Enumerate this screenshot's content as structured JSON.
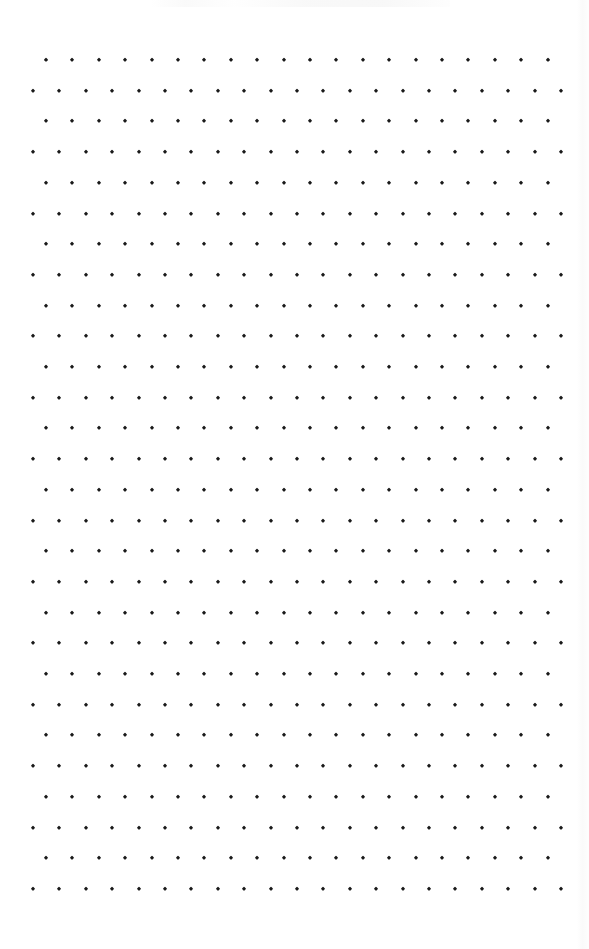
{
  "page": {
    "name": "dot-grid-notebook-page",
    "width": 589,
    "height": 949,
    "background_color": "#ffffff"
  },
  "grid": {
    "dot_color": "#1a1a1a",
    "dot_size_px": 3.4,
    "dot_shape": "diamond",
    "row_count": 28,
    "row_spacing_px": 30.7,
    "column_spacing_px": 26.4,
    "first_row_center_y": 60,
    "last_row_center_y": 888,
    "odd_rows": {
      "dot_count": 20,
      "first_dot_x": 46,
      "last_dot_x": 548
    },
    "even_rows": {
      "dot_count": 21,
      "first_dot_x": 33,
      "last_dot_x": 562
    },
    "offset_style": "staggered-alternating"
  },
  "artifacts": {
    "right_edge_shading": "#f9f9f9",
    "top_edge_smudges": "#f8f8f8"
  },
  "content": {
    "text_present": false,
    "handwriting_present": false,
    "labels": []
  }
}
